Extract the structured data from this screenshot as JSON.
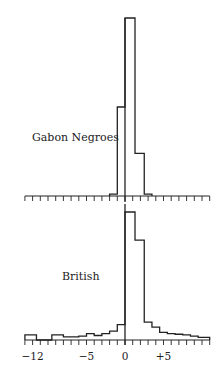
{
  "chart_data": {
    "type": "bar",
    "title": "",
    "xlabel": "",
    "ylabel": "",
    "xlim": [
      -13,
      11
    ],
    "x_ticks": [
      -12,
      -5,
      0,
      5
    ],
    "x_tick_labels": [
      "−12",
      "−5",
      "0",
      "+5"
    ],
    "panels": [
      {
        "name": "Gabon Negroes",
        "bins": [
          {
            "x0": -2,
            "x1": -1,
            "value": 1
          },
          {
            "x0": -1,
            "x1": 0,
            "value": 50
          },
          {
            "x0": 0,
            "x1": 1.3,
            "value": 100
          },
          {
            "x0": 1.3,
            "x1": 2.5,
            "value": 24
          },
          {
            "x0": 2.5,
            "x1": 3.5,
            "value": 1
          }
        ]
      },
      {
        "name": "British",
        "bins": [
          {
            "x0": -13,
            "x1": -11.5,
            "value": 4
          },
          {
            "x0": -11.5,
            "x1": -9.5,
            "value": 0
          },
          {
            "x0": -9.5,
            "x1": -8,
            "value": 4
          },
          {
            "x0": -8,
            "x1": -6,
            "value": 2.5
          },
          {
            "x0": -6,
            "x1": -5,
            "value": 3
          },
          {
            "x0": -5,
            "x1": -4,
            "value": 5
          },
          {
            "x0": -4,
            "x1": -3,
            "value": 3.5
          },
          {
            "x0": -3,
            "x1": -2,
            "value": 5
          },
          {
            "x0": -2,
            "x1": -1,
            "value": 7
          },
          {
            "x0": -1,
            "x1": 0,
            "value": 12
          },
          {
            "x0": 0,
            "x1": 1.3,
            "value": 100
          },
          {
            "x0": 1.3,
            "x1": 2.5,
            "value": 78
          },
          {
            "x0": 2.5,
            "x1": 3.5,
            "value": 14
          },
          {
            "x0": 3.5,
            "x1": 4.5,
            "value": 10
          },
          {
            "x0": 4.5,
            "x1": 5.5,
            "value": 6
          },
          {
            "x0": 5.5,
            "x1": 6.5,
            "value": 5
          },
          {
            "x0": 6.5,
            "x1": 7.5,
            "value": 4.5
          },
          {
            "x0": 7.5,
            "x1": 8.5,
            "value": 4
          },
          {
            "x0": 8.5,
            "x1": 9.5,
            "value": 3
          },
          {
            "x0": 9.5,
            "x1": 11,
            "value": 2
          }
        ]
      }
    ],
    "grid": false,
    "legend": "none; panel labels placed inside plot area"
  },
  "panels": {
    "top_label": "Gabon Negroes",
    "bottom_label": "British"
  }
}
